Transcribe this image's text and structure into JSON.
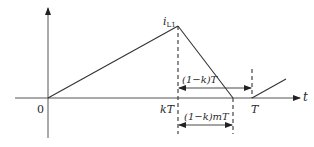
{
  "diagram": {
    "title": "",
    "type": "inductor current waveform",
    "colors": {
      "line": "#333333",
      "background": "#ffffff"
    },
    "axes": {
      "x_label": "t",
      "origin_label": "0"
    },
    "labels": {
      "peak_symbol": "i",
      "peak_subscript": "L1",
      "kT": "kT",
      "T": "T",
      "off_interval": "(1−k)T",
      "discharge_interval": "(1−k)mT"
    },
    "points": {
      "origin": [
        0,
        0
      ],
      "peak": [
        "kT",
        "iL1"
      ],
      "zero_reached": [
        "kT+(1-k)mT",
        0
      ],
      "period_end": [
        "T",
        0
      ]
    }
  }
}
